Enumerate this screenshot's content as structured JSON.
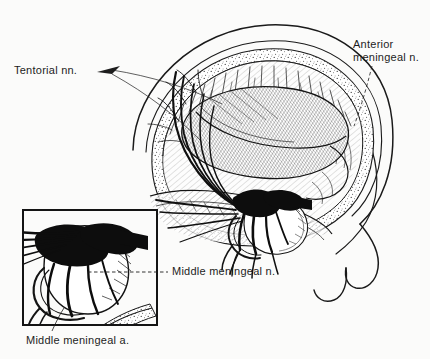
{
  "figure": {
    "kind": "anatomical-line-illustration",
    "background_color": "#fbfbfa",
    "ink_color": "#1a1a1a",
    "width": 430,
    "height": 359
  },
  "labels": {
    "tentorial": "Tentorial nn.",
    "anterior_line1": "Anterior",
    "anterior_line2": "meningeal n.",
    "middle_nerve": "Middle meningeal n.",
    "middle_artery": "Middle meningeal a."
  },
  "leaders": {
    "tentorial_style": "two thin solid fanning lines with arrow notch",
    "anterior_style": "thin dashed line descending left to the stippled bone band",
    "middle_nerve_style": "horizontal dashed line into the inset detail",
    "middle_artery_style": "short thin solid line rising into the inset box"
  },
  "inset": {
    "name": "magnified-detail-box",
    "border_color": "#1a1a1a",
    "x": 23,
    "y": 210,
    "width": 134,
    "height": 115,
    "content": "Enlargement of the middle meningeal nerve and artery at the foramen spinosum, with dense black ganglion mass"
  },
  "structures": [
    "outer scalp / skull contour",
    "stippled diploe bone band",
    "dura mater with fine hatching",
    "tentorium cerebelli (dense diagonal hatching)",
    "nerve branch fan (tentorial nerves)",
    "middle meningeal nerve and ganglion (solid black)",
    "middle meningeal artery"
  ]
}
